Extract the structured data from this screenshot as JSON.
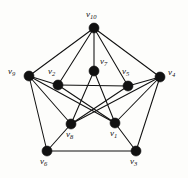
{
  "figure": {
    "name": "graph-diagram",
    "type": "undirected-graph-drawing",
    "background_color": "#fdfdfb",
    "stroke_color": "#111111",
    "width": 188,
    "height": 178
  },
  "graph": {
    "vertex_count": 10,
    "edge_count": 20,
    "vertices": [
      {
        "id": "v10",
        "label": "v",
        "sub": "10",
        "x": 94,
        "y": 28,
        "r": 5.0,
        "label_x": 86,
        "label_y": 10
      },
      {
        "id": "v9",
        "label": "v",
        "sub": "9",
        "x": 29,
        "y": 76,
        "r": 5.0,
        "label_x": 8,
        "label_y": 67
      },
      {
        "id": "v4",
        "label": "v",
        "sub": "4",
        "x": 160,
        "y": 77,
        "r": 5.0,
        "label_x": 168,
        "label_y": 68
      },
      {
        "id": "v6",
        "label": "v",
        "sub": "6",
        "x": 47,
        "y": 151,
        "r": 5.0,
        "label_x": 40,
        "label_y": 157
      },
      {
        "id": "v3",
        "label": "v",
        "sub": "3",
        "x": 136,
        "y": 151,
        "r": 5.0,
        "label_x": 130,
        "label_y": 157
      },
      {
        "id": "v2",
        "label": "v",
        "sub": "2",
        "x": 58,
        "y": 85,
        "r": 5.0,
        "label_x": 48,
        "label_y": 67
      },
      {
        "id": "v7",
        "label": "v",
        "sub": "7",
        "x": 94,
        "y": 71,
        "r": 5.0,
        "label_x": 100,
        "label_y": 57
      },
      {
        "id": "v5",
        "label": "v",
        "sub": "5",
        "x": 128,
        "y": 86,
        "r": 5.0,
        "label_x": 122,
        "label_y": 67
      },
      {
        "id": "v8",
        "label": "v",
        "sub": "8",
        "x": 71,
        "y": 124,
        "r": 5.0,
        "label_x": 66,
        "label_y": 130
      },
      {
        "id": "v1",
        "label": "v",
        "sub": "1",
        "x": 115,
        "y": 123,
        "r": 5.0,
        "label_x": 110,
        "label_y": 129
      }
    ],
    "edges": [
      {
        "from": "v10",
        "to": "v9"
      },
      {
        "from": "v10",
        "to": "v4"
      },
      {
        "from": "v10",
        "to": "v2"
      },
      {
        "from": "v10",
        "to": "v7"
      },
      {
        "from": "v10",
        "to": "v5"
      },
      {
        "from": "v9",
        "to": "v2"
      },
      {
        "from": "v9",
        "to": "v6"
      },
      {
        "from": "v9",
        "to": "v8"
      },
      {
        "from": "v9",
        "to": "v1"
      },
      {
        "from": "v4",
        "to": "v5"
      },
      {
        "from": "v4",
        "to": "v3"
      },
      {
        "from": "v4",
        "to": "v1"
      },
      {
        "from": "v4",
        "to": "v8"
      },
      {
        "from": "v6",
        "to": "v3"
      },
      {
        "from": "v6",
        "to": "v8"
      },
      {
        "from": "v3",
        "to": "v1"
      },
      {
        "from": "v2",
        "to": "v5"
      },
      {
        "from": "v2",
        "to": "v1"
      },
      {
        "from": "v5",
        "to": "v8"
      },
      {
        "from": "v7",
        "to": "v8"
      },
      {
        "from": "v7",
        "to": "v1"
      }
    ]
  }
}
